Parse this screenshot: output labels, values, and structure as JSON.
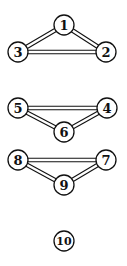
{
  "diagram": {
    "type": "graph",
    "edge_style": "double-line",
    "nodes": [
      {
        "id": "1",
        "label": "1",
        "x": 64,
        "y": 25
      },
      {
        "id": "2",
        "label": "2",
        "x": 106,
        "y": 52
      },
      {
        "id": "3",
        "label": "3",
        "x": 18,
        "y": 52
      },
      {
        "id": "4",
        "label": "4",
        "x": 107,
        "y": 108
      },
      {
        "id": "5",
        "label": "5",
        "x": 18,
        "y": 108
      },
      {
        "id": "6",
        "label": "6",
        "x": 64,
        "y": 132
      },
      {
        "id": "7",
        "label": "7",
        "x": 106,
        "y": 160
      },
      {
        "id": "8",
        "label": "8",
        "x": 18,
        "y": 160
      },
      {
        "id": "9",
        "label": "9",
        "x": 64,
        "y": 185
      },
      {
        "id": "10",
        "label": "10",
        "x": 64,
        "y": 241
      }
    ],
    "edges": [
      {
        "from": "1",
        "to": "2"
      },
      {
        "from": "1",
        "to": "3"
      },
      {
        "from": "3",
        "to": "2"
      },
      {
        "from": "5",
        "to": "4"
      },
      {
        "from": "5",
        "to": "6"
      },
      {
        "from": "6",
        "to": "4"
      },
      {
        "from": "8",
        "to": "7"
      },
      {
        "from": "8",
        "to": "9"
      },
      {
        "from": "9",
        "to": "7"
      }
    ]
  }
}
